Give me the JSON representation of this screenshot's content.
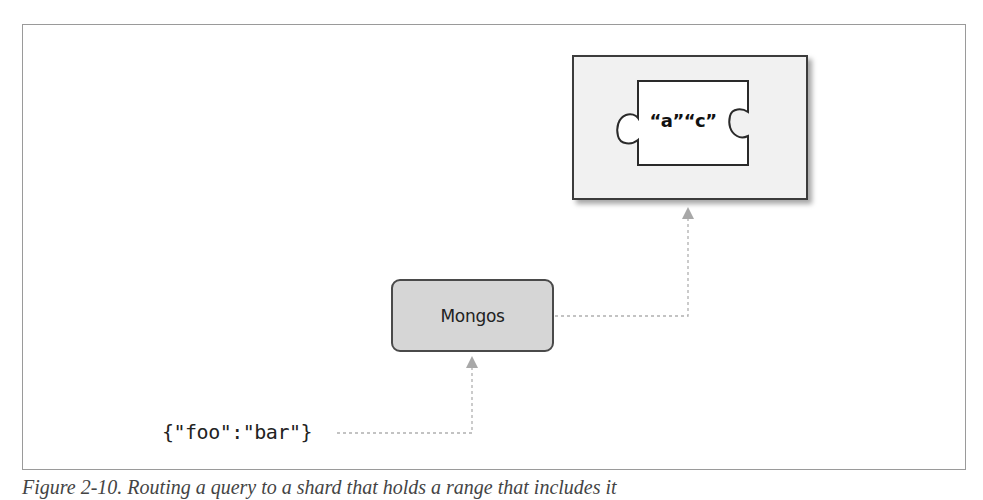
{
  "diagram": {
    "shard": {
      "chunk_range_label": "“a”“c”",
      "chunk_shape": "puzzle-piece"
    },
    "router": {
      "label": "Mongos"
    },
    "query": {
      "text": "{\"foo\":\"bar\"}"
    },
    "connectors": [
      {
        "from": "query",
        "to": "router",
        "style": "dashed",
        "arrow": "up"
      },
      {
        "from": "router",
        "to": "shard",
        "style": "dashed",
        "arrow": "up"
      }
    ],
    "colors": {
      "frame_border": "#9a9a9a",
      "shard_fill": "#f1f1f1",
      "shard_border": "#3c3c3c",
      "router_fill": "#d6d6d6",
      "connector": "#b0b0b0",
      "arrowhead": "#a8a8a8"
    }
  },
  "caption": {
    "text": "Figure 2-10. Routing a query to a shard that holds a range that includes it"
  }
}
